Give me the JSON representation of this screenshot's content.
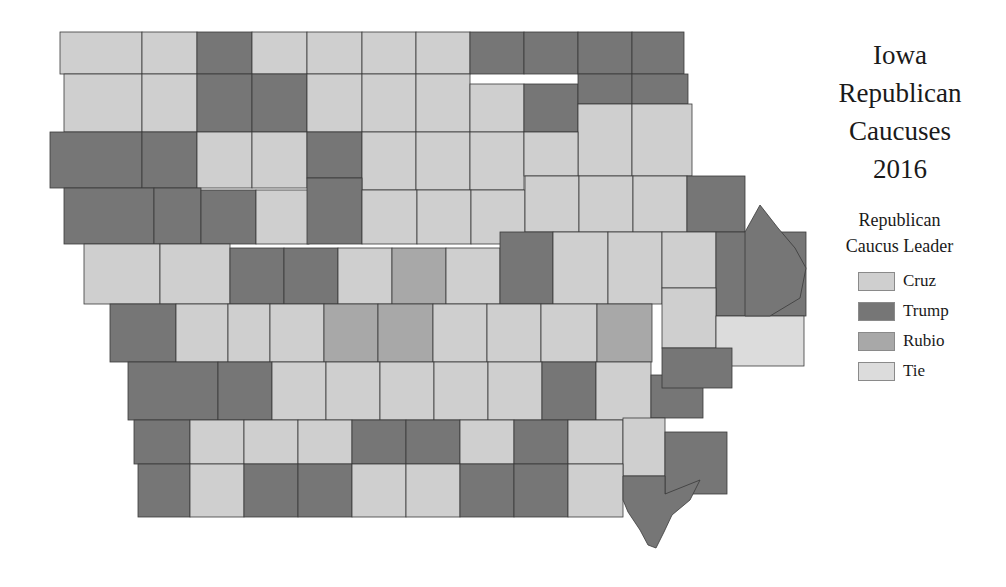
{
  "title": {
    "line1": "Iowa",
    "line2": "Republican",
    "line3": "Caucuses",
    "line4": "2016"
  },
  "legend": {
    "title_line1": "Republican",
    "title_line2": "Caucus Leader",
    "items": [
      {
        "label": "Cruz",
        "color": "#cfcfcf"
      },
      {
        "label": "Trump",
        "color": "#767676"
      },
      {
        "label": "Rubio",
        "color": "#a8a8a8"
      },
      {
        "label": "Tie",
        "color": "#dcdcdc"
      }
    ]
  },
  "colors": {
    "Cruz": "#cfcfcf",
    "Trump": "#767676",
    "Rubio": "#a8a8a8",
    "Tie": "#dcdcdc",
    "border": "#3a3a3a"
  },
  "map": {
    "state": "Iowa",
    "county_count": 99,
    "counties": [
      {
        "x": 60,
        "y": 32,
        "w": 82,
        "h": 42,
        "leader": "Cruz"
      },
      {
        "x": 142,
        "y": 32,
        "w": 55,
        "h": 42,
        "leader": "Cruz"
      },
      {
        "x": 197,
        "y": 32,
        "w": 55,
        "h": 42,
        "leader": "Trump"
      },
      {
        "x": 252,
        "y": 32,
        "w": 55,
        "h": 42,
        "leader": "Cruz"
      },
      {
        "x": 307,
        "y": 32,
        "w": 55,
        "h": 42,
        "leader": "Cruz"
      },
      {
        "x": 362,
        "y": 32,
        "w": 54,
        "h": 42,
        "leader": "Cruz"
      },
      {
        "x": 416,
        "y": 32,
        "w": 54,
        "h": 42,
        "leader": "Cruz"
      },
      {
        "x": 470,
        "y": 32,
        "w": 54,
        "h": 42,
        "leader": "Trump"
      },
      {
        "x": 524,
        "y": 32,
        "w": 54,
        "h": 42,
        "leader": "Trump"
      },
      {
        "x": 578,
        "y": 32,
        "w": 54,
        "h": 42,
        "leader": "Trump"
      },
      {
        "x": 632,
        "y": 32,
        "w": 52,
        "h": 42,
        "leader": "Trump"
      },
      {
        "x": 64,
        "y": 74,
        "w": 78,
        "h": 58,
        "leader": "Cruz"
      },
      {
        "x": 142,
        "y": 74,
        "w": 55,
        "h": 58,
        "leader": "Cruz"
      },
      {
        "x": 197,
        "y": 74,
        "w": 55,
        "h": 58,
        "leader": "Trump"
      },
      {
        "x": 252,
        "y": 74,
        "w": 55,
        "h": 58,
        "leader": "Trump"
      },
      {
        "x": 307,
        "y": 74,
        "w": 55,
        "h": 58,
        "leader": "Cruz"
      },
      {
        "x": 362,
        "y": 74,
        "w": 54,
        "h": 58,
        "leader": "Cruz"
      },
      {
        "x": 416,
        "y": 74,
        "w": 54,
        "h": 58,
        "leader": "Cruz"
      },
      {
        "x": 470,
        "y": 84,
        "w": 54,
        "h": 48,
        "leader": "Cruz"
      },
      {
        "x": 524,
        "y": 84,
        "w": 54,
        "h": 48,
        "leader": "Trump"
      },
      {
        "x": 578,
        "y": 74,
        "w": 54,
        "h": 30,
        "leader": "Trump"
      },
      {
        "x": 632,
        "y": 74,
        "w": 56,
        "h": 30,
        "leader": "Trump"
      },
      {
        "x": 578,
        "y": 104,
        "w": 54,
        "h": 72,
        "leader": "Cruz"
      },
      {
        "x": 632,
        "y": 104,
        "w": 60,
        "h": 72,
        "leader": "Cruz"
      },
      {
        "x": 50,
        "y": 132,
        "w": 92,
        "h": 56,
        "leader": "Trump"
      },
      {
        "x": 142,
        "y": 132,
        "w": 55,
        "h": 56,
        "leader": "Trump"
      },
      {
        "x": 197,
        "y": 132,
        "w": 55,
        "h": 56,
        "leader": "Cruz"
      },
      {
        "x": 252,
        "y": 132,
        "w": 55,
        "h": 56,
        "leader": "Cruz"
      },
      {
        "x": 307,
        "y": 132,
        "w": 55,
        "h": 46,
        "leader": "Trump"
      },
      {
        "x": 362,
        "y": 132,
        "w": 54,
        "h": 58,
        "leader": "Cruz"
      },
      {
        "x": 416,
        "y": 132,
        "w": 54,
        "h": 58,
        "leader": "Cruz"
      },
      {
        "x": 470,
        "y": 132,
        "w": 54,
        "h": 58,
        "leader": "Cruz"
      },
      {
        "x": 524,
        "y": 132,
        "w": 54,
        "h": 44,
        "leader": "Cruz"
      },
      {
        "x": 64,
        "y": 188,
        "w": 90,
        "h": 56,
        "leader": "Trump"
      },
      {
        "x": 154,
        "y": 188,
        "w": 47,
        "h": 56,
        "leader": "Trump"
      },
      {
        "x": 201,
        "y": 190,
        "w": 55,
        "h": 54,
        "leader": "Trump"
      },
      {
        "x": 256,
        "y": 190,
        "w": 53,
        "h": 54,
        "leader": "Cruz"
      },
      {
        "x": 307,
        "y": 178,
        "w": 55,
        "h": 66,
        "leader": "Trump"
      },
      {
        "x": 362,
        "y": 190,
        "w": 55,
        "h": 54,
        "leader": "Cruz"
      },
      {
        "x": 417,
        "y": 190,
        "w": 54,
        "h": 54,
        "leader": "Cruz"
      },
      {
        "x": 471,
        "y": 190,
        "w": 54,
        "h": 54,
        "leader": "Cruz"
      },
      {
        "x": 525,
        "y": 176,
        "w": 54,
        "h": 56,
        "leader": "Cruz"
      },
      {
        "x": 579,
        "y": 176,
        "w": 54,
        "h": 56,
        "leader": "Cruz"
      },
      {
        "x": 633,
        "y": 176,
        "w": 54,
        "h": 56,
        "leader": "Cruz"
      },
      {
        "x": 687,
        "y": 176,
        "w": 58,
        "h": 56,
        "leader": "Trump"
      },
      {
        "x": 84,
        "y": 244,
        "w": 76,
        "h": 60,
        "leader": "Cruz"
      },
      {
        "x": 160,
        "y": 244,
        "w": 70,
        "h": 60,
        "leader": "Cruz"
      },
      {
        "x": 230,
        "y": 248,
        "w": 54,
        "h": 56,
        "leader": "Trump"
      },
      {
        "x": 284,
        "y": 248,
        "w": 54,
        "h": 56,
        "leader": "Trump"
      },
      {
        "x": 338,
        "y": 248,
        "w": 54,
        "h": 56,
        "leader": "Cruz"
      },
      {
        "x": 392,
        "y": 248,
        "w": 54,
        "h": 56,
        "leader": "Rubio"
      },
      {
        "x": 446,
        "y": 248,
        "w": 54,
        "h": 56,
        "leader": "Cruz"
      },
      {
        "x": 500,
        "y": 232,
        "w": 53,
        "h": 72,
        "leader": "Trump"
      },
      {
        "x": 553,
        "y": 232,
        "w": 55,
        "h": 72,
        "leader": "Cruz"
      },
      {
        "x": 608,
        "y": 232,
        "w": 54,
        "h": 72,
        "leader": "Cruz"
      },
      {
        "x": 662,
        "y": 232,
        "w": 54,
        "h": 56,
        "leader": "Cruz"
      },
      {
        "x": 716,
        "y": 232,
        "w": 90,
        "h": 84,
        "leader": "Trump"
      },
      {
        "x": 110,
        "y": 304,
        "w": 66,
        "h": 58,
        "leader": "Trump"
      },
      {
        "x": 176,
        "y": 304,
        "w": 52,
        "h": 58,
        "leader": "Cruz"
      },
      {
        "x": 228,
        "y": 304,
        "w": 42,
        "h": 58,
        "leader": "Cruz"
      },
      {
        "x": 270,
        "y": 304,
        "w": 54,
        "h": 58,
        "leader": "Cruz"
      },
      {
        "x": 324,
        "y": 304,
        "w": 54,
        "h": 58,
        "leader": "Rubio"
      },
      {
        "x": 378,
        "y": 304,
        "w": 55,
        "h": 58,
        "leader": "Rubio"
      },
      {
        "x": 433,
        "y": 304,
        "w": 54,
        "h": 58,
        "leader": "Cruz"
      },
      {
        "x": 487,
        "y": 304,
        "w": 54,
        "h": 58,
        "leader": "Cruz"
      },
      {
        "x": 541,
        "y": 304,
        "w": 56,
        "h": 58,
        "leader": "Cruz"
      },
      {
        "x": 597,
        "y": 304,
        "w": 55,
        "h": 58,
        "leader": "Rubio"
      },
      {
        "x": 662,
        "y": 288,
        "w": 54,
        "h": 60,
        "leader": "Cruz"
      },
      {
        "x": 716,
        "y": 316,
        "w": 88,
        "h": 50,
        "leader": "Tie"
      },
      {
        "x": 128,
        "y": 362,
        "w": 90,
        "h": 58,
        "leader": "Trump"
      },
      {
        "x": 218,
        "y": 362,
        "w": 54,
        "h": 58,
        "leader": "Trump"
      },
      {
        "x": 272,
        "y": 362,
        "w": 54,
        "h": 58,
        "leader": "Cruz"
      },
      {
        "x": 326,
        "y": 362,
        "w": 54,
        "h": 58,
        "leader": "Cruz"
      },
      {
        "x": 380,
        "y": 362,
        "w": 54,
        "h": 58,
        "leader": "Cruz"
      },
      {
        "x": 434,
        "y": 362,
        "w": 54,
        "h": 58,
        "leader": "Cruz"
      },
      {
        "x": 488,
        "y": 362,
        "w": 54,
        "h": 58,
        "leader": "Cruz"
      },
      {
        "x": 542,
        "y": 362,
        "w": 54,
        "h": 58,
        "leader": "Trump"
      },
      {
        "x": 596,
        "y": 362,
        "w": 55,
        "h": 58,
        "leader": "Cruz"
      },
      {
        "x": 651,
        "y": 375,
        "w": 52,
        "h": 43,
        "leader": "Trump"
      },
      {
        "x": 662,
        "y": 348,
        "w": 70,
        "h": 40,
        "leader": "Trump"
      },
      {
        "x": 134,
        "y": 420,
        "w": 56,
        "h": 44,
        "leader": "Trump"
      },
      {
        "x": 190,
        "y": 420,
        "w": 54,
        "h": 44,
        "leader": "Cruz"
      },
      {
        "x": 244,
        "y": 420,
        "w": 54,
        "h": 44,
        "leader": "Cruz"
      },
      {
        "x": 298,
        "y": 420,
        "w": 54,
        "h": 44,
        "leader": "Cruz"
      },
      {
        "x": 352,
        "y": 420,
        "w": 54,
        "h": 44,
        "leader": "Trump"
      },
      {
        "x": 406,
        "y": 420,
        "w": 54,
        "h": 44,
        "leader": "Trump"
      },
      {
        "x": 460,
        "y": 420,
        "w": 54,
        "h": 44,
        "leader": "Cruz"
      },
      {
        "x": 514,
        "y": 420,
        "w": 54,
        "h": 44,
        "leader": "Trump"
      },
      {
        "x": 568,
        "y": 420,
        "w": 55,
        "h": 44,
        "leader": "Cruz"
      },
      {
        "x": 623,
        "y": 418,
        "w": 42,
        "h": 58,
        "leader": "Cruz"
      },
      {
        "x": 665,
        "y": 432,
        "w": 62,
        "h": 62,
        "leader": "Trump"
      },
      {
        "x": 138,
        "y": 464,
        "w": 52,
        "h": 53,
        "leader": "Trump"
      },
      {
        "x": 190,
        "y": 464,
        "w": 54,
        "h": 53,
        "leader": "Cruz"
      },
      {
        "x": 244,
        "y": 464,
        "w": 54,
        "h": 53,
        "leader": "Trump"
      },
      {
        "x": 298,
        "y": 464,
        "w": 54,
        "h": 53,
        "leader": "Trump"
      },
      {
        "x": 352,
        "y": 464,
        "w": 54,
        "h": 53,
        "leader": "Cruz"
      },
      {
        "x": 406,
        "y": 464,
        "w": 54,
        "h": 53,
        "leader": "Cruz"
      },
      {
        "x": 460,
        "y": 464,
        "w": 54,
        "h": 53,
        "leader": "Trump"
      },
      {
        "x": 514,
        "y": 464,
        "w": 54,
        "h": 53,
        "leader": "Trump"
      },
      {
        "x": 568,
        "y": 464,
        "w": 55,
        "h": 53,
        "leader": "Cruz"
      }
    ]
  }
}
